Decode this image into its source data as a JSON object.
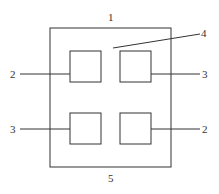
{
  "diagram": {
    "labels": {
      "top": "1",
      "upper_left": "2",
      "upper_right": "3",
      "lower_left": "3",
      "lower_right": "2",
      "pointer": "4",
      "bottom": "5"
    },
    "components": {
      "outer_frame": "1",
      "squares": [
        "2",
        "3",
        "3",
        "2"
      ],
      "gap_region": "4",
      "base": "5"
    }
  }
}
